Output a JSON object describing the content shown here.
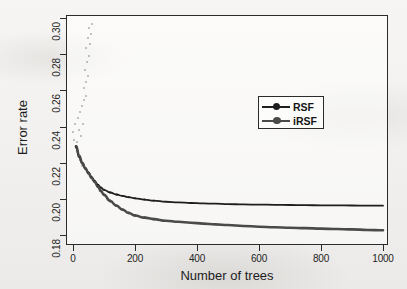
{
  "figure": {
    "background_color": "#f2f1ef",
    "frame_color": "#2b2b2b"
  },
  "axes": {
    "y_title": "Error rate",
    "x_title": "Number of trees",
    "y_ticks": [
      "0.18",
      "0.20",
      "0.22",
      "0.24",
      "0.26",
      "0.28",
      "0.30"
    ],
    "x_ticks": [
      "0",
      "200",
      "400",
      "600",
      "800",
      "1000"
    ]
  },
  "legend": {
    "position": "upper-right-inside",
    "entries": [
      {
        "label": "RSF",
        "color": "#1e1e1e",
        "marker": "circle"
      },
      {
        "label": "iRSF",
        "color": "#4a4a4a",
        "marker": "circle"
      }
    ]
  },
  "chart_data": {
    "type": "line",
    "title": "",
    "subtitle": "",
    "xlabel": "Number of trees",
    "ylabel": "Error rate",
    "xlim": [
      0,
      1000
    ],
    "ylim": [
      0.18,
      0.3
    ],
    "grid": false,
    "legend_position": "upper right",
    "x": [
      10,
      20,
      30,
      40,
      50,
      60,
      70,
      80,
      90,
      100,
      120,
      140,
      160,
      180,
      200,
      230,
      260,
      300,
      340,
      380,
      420,
      460,
      500,
      550,
      600,
      650,
      700,
      750,
      800,
      850,
      900,
      950,
      1000
    ],
    "series": [
      {
        "name": "RSF",
        "color": "#1e1e1e",
        "values": [
          0.2285,
          0.2232,
          0.2196,
          0.2168,
          0.2145,
          0.212,
          0.2098,
          0.2078,
          0.2062,
          0.205,
          0.2035,
          0.2024,
          0.2016,
          0.2009,
          0.2003,
          0.1996,
          0.199,
          0.1984,
          0.198,
          0.1977,
          0.1975,
          0.1973,
          0.1971,
          0.1969,
          0.1968,
          0.1967,
          0.1966,
          0.1965,
          0.1964,
          0.1964,
          0.1963,
          0.1962,
          0.1962
        ]
      },
      {
        "name": "iRSF",
        "color": "#4a4a4a",
        "values": [
          0.229,
          0.2236,
          0.2198,
          0.2168,
          0.2142,
          0.2116,
          0.2094,
          0.2068,
          0.2044,
          0.2022,
          0.1988,
          0.1962,
          0.194,
          0.1922,
          0.1908,
          0.1896,
          0.1888,
          0.1879,
          0.1873,
          0.1868,
          0.1863,
          0.1859,
          0.1855,
          0.185,
          0.1846,
          0.1843,
          0.184,
          0.1838,
          0.1835,
          0.1833,
          0.1831,
          0.1828,
          0.1826
        ]
      }
    ],
    "annotations": [
      "Both curves start near 0.229 at small numbers of trees and decline steeply.",
      "Curves separate at roughly 70-100 trees.",
      "RSF stabilises near 0.196; iRSF stabilises near 0.183 by 1000 trees."
    ]
  }
}
